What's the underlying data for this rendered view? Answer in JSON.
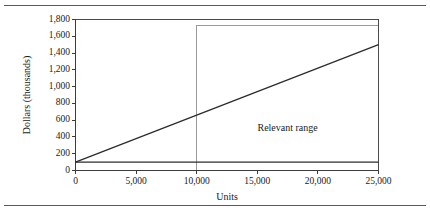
{
  "figure": {
    "name": "cost-behavior-graph",
    "has_top_rule": true,
    "has_bottom_rule": true
  },
  "chart_data": {
    "type": "line",
    "title": "",
    "xlabel": "Units",
    "ylabel": "Dollars (thousands)",
    "xlim": [
      0,
      25000
    ],
    "ylim": [
      0,
      1800
    ],
    "xticks": [
      0,
      5000,
      10000,
      15000,
      20000,
      25000
    ],
    "xtick_labels": [
      "0",
      "5,000",
      "10,000",
      "15,000",
      "20,000",
      "25,000"
    ],
    "yticks": [
      0,
      200,
      400,
      600,
      800,
      1000,
      1200,
      1400,
      1600,
      1800
    ],
    "ytick_labels": [
      "0",
      "200",
      "400",
      "600",
      "800",
      "1,000",
      "1,200",
      "1,400",
      "1,600",
      "1,800"
    ],
    "grid": false,
    "legend": null,
    "series": [
      {
        "name": "Total cost",
        "x": [
          0,
          25000
        ],
        "values": [
          100,
          1500
        ]
      },
      {
        "name": "Fixed cost",
        "x": [
          0,
          25000
        ],
        "values": [
          100,
          100
        ]
      }
    ],
    "annotations": [
      {
        "name": "relevant-range",
        "text": "Relevant range",
        "x": 17500,
        "y": 515,
        "region": {
          "x_start": 10000,
          "x_end": 25000,
          "y_bottom": 0,
          "y_top": 1730
        }
      }
    ],
    "colors": {
      "total_cost_line": "#2b2b2b",
      "fixed_cost_line": "#2b2b2b",
      "relevant_range_box": "#9a9a9a",
      "axis": "#3c3c3c",
      "frame": "#4a4a4a",
      "rule": "#5a5a5a",
      "text": "#1a1a1a",
      "background": "#ffffff"
    }
  }
}
